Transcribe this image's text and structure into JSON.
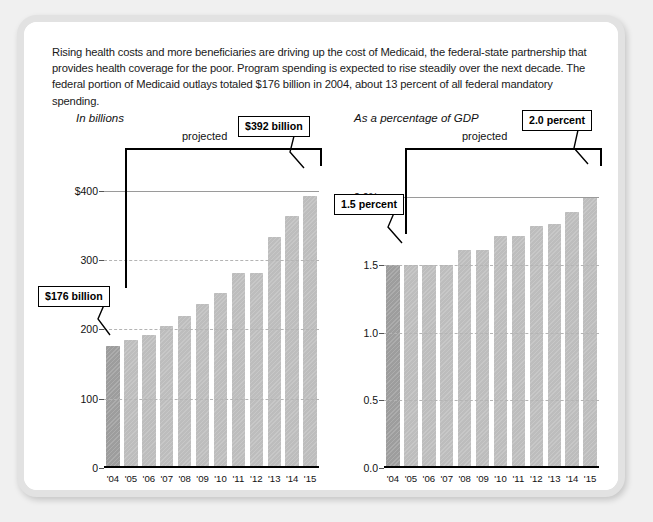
{
  "intro": {
    "text": "Rising health costs and more beneficiaries are driving up the cost of Medicaid, the federal-state partnership that provides health coverage for the poor. Program spending is expected to rise steadily over the next decade. The federal portion of Medicaid outlays totaled $176 billion in 2004, about 13 percent of all federal mandatory spending."
  },
  "colors": {
    "bar_projected": "#bdbdbd",
    "bar_actual": "#9d9d9d",
    "frame": "#e2e2e2",
    "page_background": "#f0f0f0",
    "axis": "#000000",
    "gridline": "#9a9a9a"
  },
  "charts": [
    {
      "id": "medicaid-outlays-billions",
      "title": "In billions",
      "projected_label": "projected",
      "callouts": [
        {
          "name": "first-year-callout",
          "text": "$176 billion"
        },
        {
          "name": "last-year-callout",
          "text": "$392 billion"
        }
      ],
      "ytick_labels": [
        "$400",
        "300",
        "200",
        "100",
        "0"
      ],
      "xlabels": [
        "'04",
        "'05",
        "'06",
        "'07",
        "'08",
        "'09",
        "'10",
        "'11",
        "'12",
        "'13",
        "'14",
        "'15"
      ]
    },
    {
      "id": "medicaid-outlays-pct-gdp",
      "title": "As a percentage of GDP",
      "projected_label": "projected",
      "callouts": [
        {
          "name": "first-year-callout",
          "text": "1.5 percent"
        },
        {
          "name": "last-year-callout",
          "text": "2.0 percent"
        }
      ],
      "ytick_labels": [
        "2.0%",
        "1.5",
        "1.0",
        "0.5",
        "0.0"
      ],
      "xlabels": [
        "'04",
        "'05",
        "'06",
        "'07",
        "'08",
        "'09",
        "'10",
        "'11",
        "'12",
        "'13",
        "'14",
        "'15"
      ]
    }
  ],
  "chart_data": [
    {
      "type": "bar",
      "id": "medicaid-outlays-billions",
      "title": "In billions",
      "xlabel": "",
      "ylabel": "In billions",
      "categories": [
        "'04",
        "'05",
        "'06",
        "'07",
        "'08",
        "'09",
        "'10",
        "'11",
        "'12",
        "'13",
        "'14",
        "'15"
      ],
      "values": [
        176,
        184,
        192,
        205,
        219,
        236,
        252,
        282,
        282,
        334,
        364,
        392
      ],
      "ylim": [
        0,
        430
      ],
      "yticks": [
        0,
        100,
        200,
        300,
        400
      ],
      "ytick_labels": [
        "0",
        "100",
        "200",
        "300",
        "$400"
      ],
      "grid": true,
      "legend": "none",
      "annotations": [
        {
          "text": "$176 billion",
          "category": "'04",
          "value": 176
        },
        {
          "text": "$392 billion",
          "category": "'15",
          "value": 392
        },
        {
          "text": "projected",
          "span": [
            "'05",
            "'15"
          ]
        }
      ],
      "series_styles": [
        {
          "category": "'04",
          "state": "actual"
        },
        {
          "category": "'05",
          "state": "projected"
        },
        {
          "category": "'06",
          "state": "projected"
        },
        {
          "category": "'07",
          "state": "projected"
        },
        {
          "category": "'08",
          "state": "projected"
        },
        {
          "category": "'09",
          "state": "projected"
        },
        {
          "category": "'10",
          "state": "projected"
        },
        {
          "category": "'11",
          "state": "projected"
        },
        {
          "category": "'12",
          "state": "projected"
        },
        {
          "category": "'13",
          "state": "projected"
        },
        {
          "category": "'14",
          "state": "projected"
        },
        {
          "category": "'15",
          "state": "projected"
        }
      ]
    },
    {
      "type": "bar",
      "id": "medicaid-outlays-pct-gdp",
      "title": "As a percentage of GDP",
      "xlabel": "",
      "ylabel": "As a percentage of GDP",
      "categories": [
        "'04",
        "'05",
        "'06",
        "'07",
        "'08",
        "'09",
        "'10",
        "'11",
        "'12",
        "'13",
        "'14",
        "'15"
      ],
      "values": [
        1.5,
        1.5,
        1.5,
        1.5,
        1.61,
        1.61,
        1.71,
        1.71,
        1.79,
        1.8,
        1.89,
        2.0
      ],
      "ylim": [
        0,
        2.2
      ],
      "yticks": [
        0.0,
        0.5,
        1.0,
        1.5,
        2.0
      ],
      "ytick_labels": [
        "0.0",
        "0.5",
        "1.0",
        "1.5",
        "2.0%"
      ],
      "grid": true,
      "legend": "none",
      "annotations": [
        {
          "text": "1.5 percent",
          "category": "'04",
          "value": 1.5
        },
        {
          "text": "2.0 percent",
          "category": "'15",
          "value": 2.0
        },
        {
          "text": "projected",
          "span": [
            "'05",
            "'15"
          ]
        }
      ],
      "series_styles": [
        {
          "category": "'04",
          "state": "actual"
        },
        {
          "category": "'05",
          "state": "projected"
        },
        {
          "category": "'06",
          "state": "projected"
        },
        {
          "category": "'07",
          "state": "projected"
        },
        {
          "category": "'08",
          "state": "projected"
        },
        {
          "category": "'09",
          "state": "projected"
        },
        {
          "category": "'10",
          "state": "projected"
        },
        {
          "category": "'11",
          "state": "projected"
        },
        {
          "category": "'12",
          "state": "projected"
        },
        {
          "category": "'13",
          "state": "projected"
        },
        {
          "category": "'14",
          "state": "projected"
        },
        {
          "category": "'15",
          "state": "projected"
        }
      ]
    }
  ]
}
